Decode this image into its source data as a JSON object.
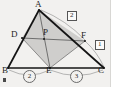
{
  "figure": {
    "kind": "geometry-diagram",
    "background_color": "#f2f1ef",
    "stroke_color": "#1d1d1d",
    "thin_stroke_color": "#6f6f6f",
    "shade_fill": "#c9c8c5",
    "points": {
      "A": {
        "label": "A",
        "x": 39,
        "y": 10,
        "label_x": 35,
        "label_y": 0
      },
      "B": {
        "label": "B",
        "x": 8,
        "y": 68,
        "label_x": 3,
        "label_y": 66
      },
      "C": {
        "label": "C",
        "x": 104,
        "y": 68,
        "label_x": 99,
        "label_y": 66
      },
      "D": {
        "label": "D",
        "x": 22,
        "y": 38,
        "label_x": 12,
        "label_y": 31
      },
      "E": {
        "label": "E",
        "x": 50,
        "y": 68,
        "label_x": 47,
        "label_y": 66
      },
      "F": {
        "label": "F",
        "x": 85,
        "y": 41,
        "label_x": 82,
        "label_y": 32
      },
      "P": {
        "label": "P",
        "x": 46,
        "y": 38,
        "label_x": 44,
        "label_y": 29
      }
    },
    "boxed_labels": [
      {
        "name": "ratio-af-fc",
        "text": "2",
        "x": 68,
        "y": 12
      },
      {
        "name": "ratio-fc",
        "text": "1",
        "x": 96,
        "y": 41
      }
    ],
    "circled_labels": [
      {
        "name": "segment-be",
        "text": "2",
        "x": 24,
        "y": 71
      },
      {
        "name": "segment-ec",
        "text": "3",
        "x": 71,
        "y": 71
      }
    ],
    "segments": [
      {
        "name": "side-ab",
        "from": "A",
        "to": "B",
        "weight": "bold"
      },
      {
        "name": "side-bc",
        "from": "B",
        "to": "C",
        "weight": "bold"
      },
      {
        "name": "side-ac",
        "from": "A",
        "to": "C",
        "weight": "bold"
      },
      {
        "name": "cevian-ae",
        "from": "A",
        "to": "E",
        "weight": "thin"
      },
      {
        "name": "cevian-df",
        "from": "D",
        "to": "F",
        "weight": "thin"
      },
      {
        "name": "cevian-de",
        "from": "D",
        "to": "E",
        "weight": "thin"
      },
      {
        "name": "cevian-ef",
        "from": "E",
        "to": "F",
        "weight": "thin"
      },
      {
        "name": "cevian-ad",
        "from": "A",
        "to": "D",
        "weight": "thin"
      }
    ],
    "shaded_region": {
      "name": "quadrilateral-adef",
      "vertices": [
        "A",
        "D",
        "E",
        "F"
      ]
    },
    "arcs": [
      {
        "name": "arc-be",
        "from": "B",
        "to": "E"
      },
      {
        "name": "arc-ec",
        "from": "E",
        "to": "C"
      },
      {
        "name": "arc-af",
        "from": "A",
        "to": "F"
      },
      {
        "name": "arc-fc",
        "from": "F",
        "to": "C"
      }
    ]
  }
}
